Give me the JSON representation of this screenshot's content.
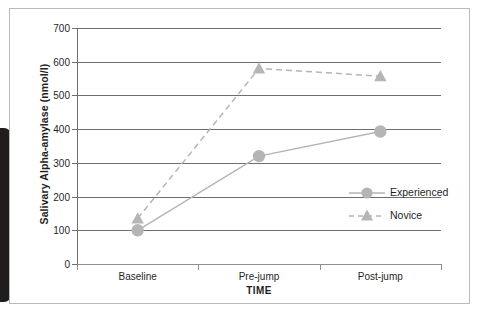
{
  "figure": {
    "y_axis_title": "Salivary Alpha-amylase (nmol/l)",
    "x_axis_title": "TIME"
  },
  "chart_data": {
    "type": "line",
    "title": "",
    "xlabel": "TIME",
    "ylabel": "Salivary Alpha-amylase (nmol/l)",
    "categories": [
      "Baseline",
      "Pre-jump",
      "Post-jump"
    ],
    "ylim": [
      0,
      700
    ],
    "yticks": [
      0,
      100,
      200,
      300,
      400,
      500,
      600,
      700
    ],
    "ytick_labels": [
      "0",
      "100",
      "200",
      "300",
      "400",
      "500",
      "600",
      "700"
    ],
    "grid": true,
    "legend_position": "center-right",
    "series": [
      {
        "name": "Experienced",
        "marker": "circle",
        "linestyle": "solid",
        "color": "#b5b5b5",
        "values": [
          100,
          320,
          393
        ]
      },
      {
        "name": "Novice",
        "marker": "triangle",
        "linestyle": "dashed",
        "color": "#b5b5b5",
        "values": [
          135,
          580,
          557
        ]
      }
    ]
  },
  "legend": {
    "items": [
      {
        "label": "Experienced",
        "marker": "circle-marker",
        "style": "solid"
      },
      {
        "label": "Novice",
        "marker": "triangle-marker",
        "style": "dashed"
      }
    ]
  },
  "colors": {
    "series_gray": "#b5b5b5",
    "gridline": "#6e6e6e",
    "axis": "#8f8f8f",
    "text": "#1f1f1f",
    "frame": "#b9b9b9",
    "scan_shadow": "#201e1d"
  }
}
